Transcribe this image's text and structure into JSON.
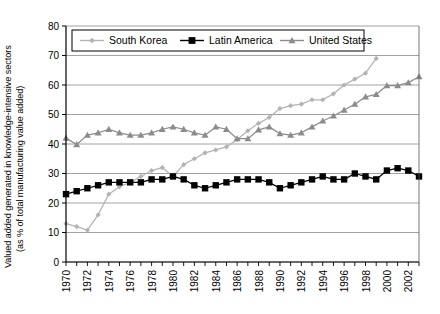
{
  "chart_data": {
    "type": "line",
    "title": "",
    "xlabel": "",
    "ylabel_line1": "Valued added generated in knowledge-intensive sectors",
    "ylabel_line2": "(as % of total manufacturing value added)",
    "ylim": [
      0,
      80
    ],
    "ytick_values": [
      0,
      10,
      20,
      30,
      40,
      50,
      60,
      70,
      80
    ],
    "ytick_labels": [
      "0",
      "10",
      "20",
      "30",
      "40",
      "50",
      "60",
      "70",
      "80"
    ],
    "xlim": [
      1970,
      2003
    ],
    "x": [
      1970,
      1971,
      1972,
      1973,
      1974,
      1975,
      1976,
      1977,
      1978,
      1979,
      1980,
      1981,
      1982,
      1983,
      1984,
      1985,
      1986,
      1987,
      1988,
      1989,
      1990,
      1991,
      1992,
      1993,
      1994,
      1995,
      1996,
      1997,
      1998,
      1999,
      2000,
      2001,
      2002,
      2003
    ],
    "xtick_labels": [
      "1970",
      "1972",
      "1974",
      "1976",
      "1978",
      "1980",
      "1982",
      "1984",
      "1986",
      "1988",
      "1990",
      "1992",
      "1994",
      "1996",
      "1998",
      "2000",
      "2002"
    ],
    "xtick_values": [
      1970,
      1972,
      1974,
      1976,
      1978,
      1980,
      1982,
      1984,
      1986,
      1988,
      1990,
      1992,
      1994,
      1996,
      1998,
      2000,
      2002
    ],
    "grid": "horizontal",
    "legend_position": "top",
    "series": [
      {
        "name": "South Korea",
        "color": "#b3b3b3",
        "marker": "diamond",
        "x": [
          1970,
          1971,
          1972,
          1973,
          1974,
          1975,
          1976,
          1977,
          1978,
          1979,
          1980,
          1981,
          1982,
          1983,
          1984,
          1985,
          1986,
          1987,
          1988,
          1989,
          1990,
          1991,
          1992,
          1993,
          1994,
          1995,
          1996,
          1997,
          1998,
          1999
        ],
        "values": [
          13.0,
          12.0,
          10.8,
          16.0,
          23.0,
          25.5,
          27.0,
          29.0,
          31.0,
          32.0,
          29.0,
          33.0,
          35.0,
          37.0,
          38.0,
          39.0,
          41.5,
          44.5,
          47.0,
          49.0,
          52.0,
          53.0,
          53.5,
          55.0,
          55.0,
          57.0,
          60.0,
          62.0,
          64.0,
          69.0
        ]
      },
      {
        "name": "Latin America",
        "color": "#000000",
        "marker": "square",
        "x": [
          1970,
          1971,
          1972,
          1973,
          1974,
          1975,
          1976,
          1977,
          1978,
          1979,
          1980,
          1981,
          1982,
          1983,
          1984,
          1985,
          1986,
          1987,
          1988,
          1989,
          1990,
          1991,
          1992,
          1993,
          1994,
          1995,
          1996,
          1997,
          1998,
          1999,
          2000,
          2001,
          2002,
          2003
        ],
        "values": [
          23.0,
          24.0,
          25.0,
          26.0,
          27.0,
          27.0,
          27.0,
          27.0,
          28.0,
          28.0,
          29.0,
          28.0,
          26.0,
          25.0,
          26.0,
          27.0,
          28.0,
          28.0,
          28.0,
          27.0,
          25.0,
          26.0,
          27.0,
          28.0,
          29.0,
          28.0,
          28.0,
          30.0,
          29.0,
          28.0,
          31.0,
          31.8,
          31.0,
          29.0
        ]
      },
      {
        "name": "United States",
        "color": "#8c8c8c",
        "marker": "triangle",
        "x": [
          1970,
          1971,
          1972,
          1973,
          1974,
          1975,
          1976,
          1977,
          1978,
          1979,
          1980,
          1981,
          1982,
          1983,
          1984,
          1985,
          1986,
          1987,
          1988,
          1989,
          1990,
          1991,
          1992,
          1993,
          1994,
          1995,
          1996,
          1997,
          1998,
          1999,
          2000,
          2001,
          2002,
          2003
        ],
        "values": [
          42.0,
          39.8,
          43.0,
          43.8,
          45.0,
          43.8,
          43.0,
          43.0,
          43.8,
          45.0,
          45.8,
          45.0,
          43.8,
          43.0,
          45.8,
          45.0,
          41.8,
          41.8,
          44.8,
          45.8,
          43.5,
          43.0,
          43.8,
          45.8,
          47.8,
          49.5,
          51.5,
          53.5,
          56.0,
          56.8,
          59.8,
          59.8,
          60.8,
          62.8
        ]
      }
    ]
  },
  "legend": {
    "items": [
      {
        "label": "South Korea",
        "color": "#b3b3b3",
        "marker": "diamond"
      },
      {
        "label": "Latin America",
        "color": "#000000",
        "marker": "square"
      },
      {
        "label": "United States",
        "color": "#8c8c8c",
        "marker": "triangle"
      }
    ]
  }
}
